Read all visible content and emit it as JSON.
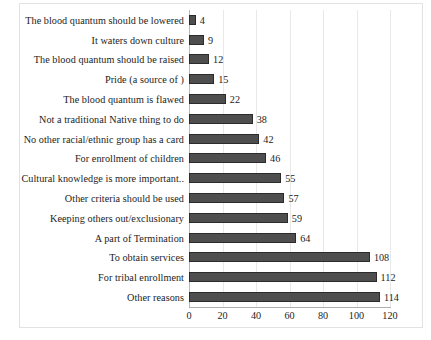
{
  "chart_data": {
    "type": "bar",
    "orientation": "horizontal",
    "title": "",
    "subtitle": "",
    "xlabel": "",
    "ylabel": "",
    "xlim": [
      0,
      120
    ],
    "xticks": [
      0,
      20,
      40,
      60,
      80,
      100,
      120
    ],
    "grid": true,
    "legend": false,
    "bar_color": "#4e4e4e",
    "bar_edge_color": "#2b2b2b",
    "gridline_color": "#e8e8e8",
    "axis_color": "#b0b0b0",
    "categories": [
      "The blood quantum should be lowered",
      "It waters down culture",
      "The blood quantum should be raised",
      "Pride (a source of )",
      "The blood quantum is flawed",
      "Not a traditional Native thing to do",
      "No other racial/ethnic group has a card",
      "For enrollment of children",
      "Cultural knowledge is more important..",
      "Other criteria should be used",
      "Keeping others out/exclusionary",
      "A part of Termination",
      "To obtain services",
      "For tribal enrollment",
      "Other reasons"
    ],
    "values": [
      4,
      9,
      12,
      15,
      22,
      38,
      42,
      46,
      55,
      57,
      59,
      64,
      108,
      112,
      114
    ],
    "value_labels": [
      "4",
      "9",
      "12",
      "15",
      "22",
      "38",
      "42",
      "46",
      "55",
      "57",
      "59",
      "64",
      "108",
      "112",
      "114"
    ],
    "xtick_labels": [
      "0",
      "20",
      "40",
      "60",
      "80",
      "100",
      "120"
    ]
  }
}
